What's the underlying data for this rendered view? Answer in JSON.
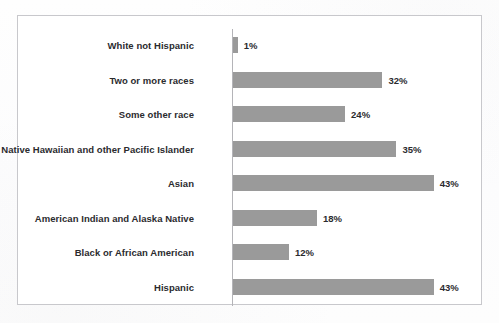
{
  "chart_data": {
    "type": "bar",
    "orientation": "horizontal",
    "title": "",
    "xlabel": "",
    "ylabel": "",
    "xlim": [
      0,
      50
    ],
    "grid": false,
    "legend": null,
    "value_suffix": "%",
    "bar_color": "#9a9a9a",
    "frame_color": "#c8c8cc",
    "axis_color": "#b4b4b8",
    "text_color": "#2b2b2e",
    "categories": [
      "White not Hispanic",
      "Two or more races",
      "Some other race",
      "Native Hawaiian and other Pacific Islander",
      "Asian",
      "American Indian and Alaska Native",
      "Black or African American",
      "Hispanic"
    ],
    "values": [
      1,
      32,
      24,
      35,
      43,
      18,
      12,
      43
    ],
    "value_labels": [
      "1%",
      "32%",
      "24%",
      "35%",
      "43%",
      "18%",
      "12%",
      "43%"
    ]
  }
}
